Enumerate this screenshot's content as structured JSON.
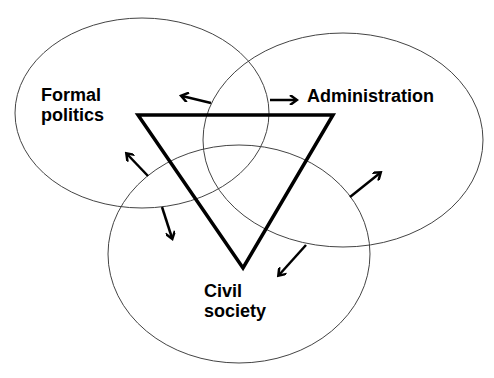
{
  "diagram": {
    "type": "venn-with-triangle",
    "colors": {
      "circle_stroke": "#444444",
      "triangle_stroke": "#000000",
      "arrow_stroke": "#000000",
      "background": "#ffffff"
    },
    "circles": [
      {
        "id": "formal-politics",
        "label_lines": [
          "Formal",
          "politics"
        ],
        "cx": 142,
        "cy": 113,
        "rx": 127,
        "ry": 95
      },
      {
        "id": "administration",
        "label_lines": [
          "Administration"
        ],
        "cx": 343,
        "cy": 140,
        "rx": 140,
        "ry": 107
      },
      {
        "id": "civil-society",
        "label_lines": [
          "Civil",
          "society"
        ],
        "cx": 239,
        "cy": 254,
        "rx": 131,
        "ry": 109
      }
    ],
    "triangle": {
      "points": [
        [
          138,
          115
        ],
        [
          333,
          115
        ],
        [
          243,
          268
        ]
      ],
      "orientation": "inverted"
    },
    "arrows": [
      {
        "from": [
          211,
          103
        ],
        "to": [
          182,
          96
        ],
        "direction": "left"
      },
      {
        "from": [
          270,
          100
        ],
        "to": [
          296,
          100
        ],
        "direction": "right"
      },
      {
        "from": [
          148,
          176
        ],
        "to": [
          127,
          154
        ],
        "direction": "up-left"
      },
      {
        "from": [
          162,
          207
        ],
        "to": [
          172,
          238
        ],
        "direction": "down"
      },
      {
        "from": [
          350,
          197
        ],
        "to": [
          380,
          173
        ],
        "direction": "up-right"
      },
      {
        "from": [
          306,
          245
        ],
        "to": [
          279,
          275
        ],
        "direction": "down-left"
      }
    ]
  },
  "labels": {
    "formal_line1": "Formal",
    "formal_line2": "politics",
    "administration": "Administration",
    "civil_line1": "Civil",
    "civil_line2": "society"
  }
}
